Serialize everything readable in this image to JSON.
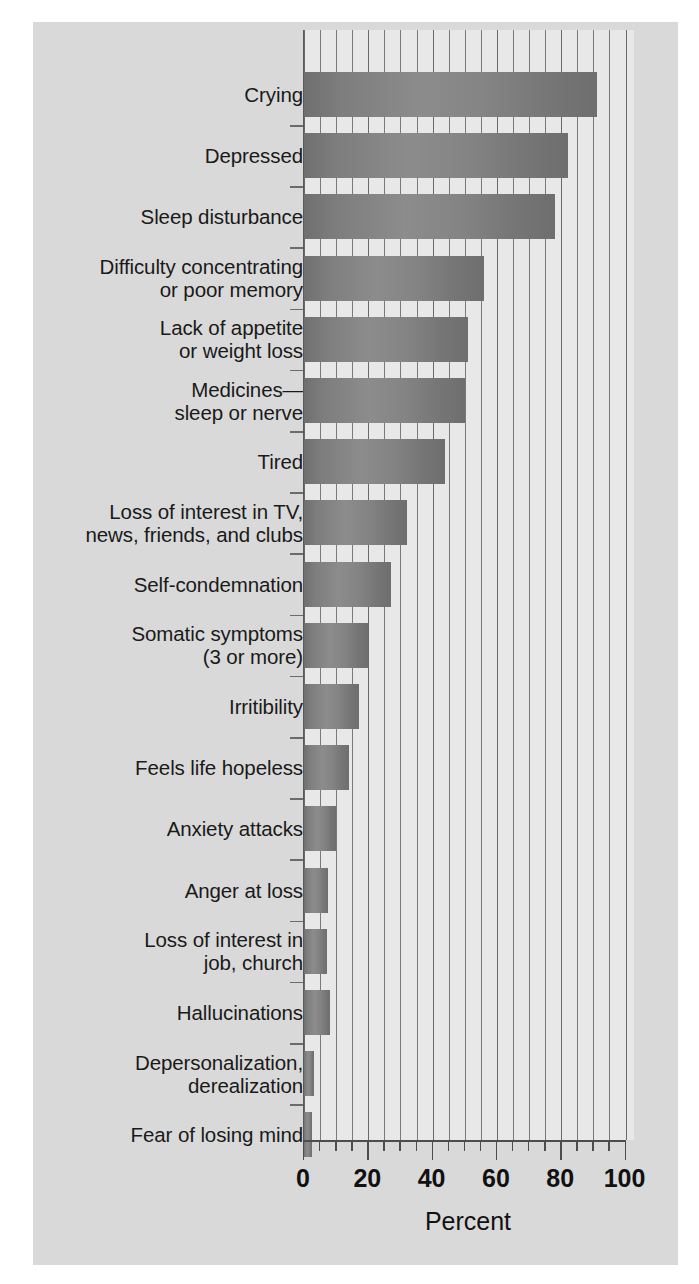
{
  "chart_data": {
    "type": "bar",
    "orientation": "horizontal",
    "title": "",
    "xlabel": "Percent",
    "ylabel": "",
    "xlim": [
      0,
      100
    ],
    "xticks": [
      0,
      20,
      40,
      60,
      80,
      100
    ],
    "xtick_labels": [
      "0",
      "20",
      "40",
      "60",
      "80",
      "100"
    ],
    "minor_tick_step": 5,
    "grid": "vertical",
    "legend": "none",
    "bar_color": "#808080",
    "plot_background": "#e8e8e8",
    "figure_background": "#d9d9d9",
    "categories": [
      "Crying",
      "Depressed",
      "Sleep disturbance",
      "Difficulty concentrating or poor memory",
      "Lack of appetite or weight loss",
      "Medicines—sleep or nerve",
      "Tired",
      "Loss of interest in TV, news, friends, and clubs",
      "Self-condemnation",
      "Somatic symptoms (3 or more)",
      "Irritibility",
      "Feels life hopeless",
      "Anxiety attacks",
      "Anger at loss",
      "Loss of interest in job, church",
      "Hallucinations",
      "Depersonalization, derealization",
      "Fear of losing mind"
    ],
    "values": [
      91,
      82,
      78,
      56,
      51,
      50,
      44,
      32,
      27,
      20,
      17,
      14,
      10,
      7.5,
      7,
      8,
      3,
      2.5
    ]
  },
  "categories_lines": [
    [
      "Crying"
    ],
    [
      "Depressed"
    ],
    [
      "Sleep disturbance"
    ],
    [
      "Difficulty concentrating",
      "or poor memory"
    ],
    [
      "Lack of appetite",
      "or weight loss"
    ],
    [
      "Medicines—",
      "sleep or nerve"
    ],
    [
      "Tired"
    ],
    [
      "Loss of interest in TV,",
      "news, friends, and clubs"
    ],
    [
      "Self-condemnation"
    ],
    [
      "Somatic symptoms",
      "(3 or more)"
    ],
    [
      "Irritibility"
    ],
    [
      "Feels life hopeless"
    ],
    [
      "Anxiety attacks"
    ],
    [
      "Anger at loss"
    ],
    [
      "Loss of interest in",
      "job, church"
    ],
    [
      "Hallucinations"
    ],
    [
      "Depersonalization,",
      "derealization"
    ],
    [
      "Fear of losing mind"
    ]
  ]
}
